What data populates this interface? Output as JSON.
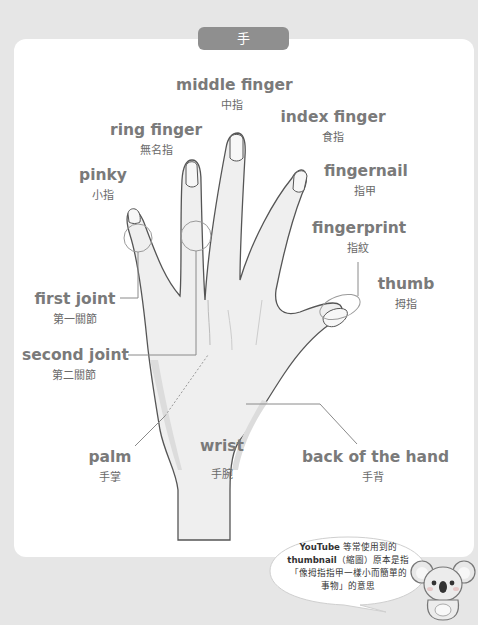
{
  "title": "手",
  "labels": {
    "middle_finger": {
      "en": "middle finger",
      "zh": "中指"
    },
    "index_finger": {
      "en": "index finger",
      "zh": "食指"
    },
    "ring_finger": {
      "en": "ring finger",
      "zh": "無名指"
    },
    "pinky": {
      "en": "pinky",
      "zh": "小指"
    },
    "fingernail": {
      "en": "fingernail",
      "zh": "指甲"
    },
    "fingerprint": {
      "en": "fingerprint",
      "zh": "指紋"
    },
    "thumb": {
      "en": "thumb",
      "zh": "拇指"
    },
    "first_joint": {
      "en": "first joint",
      "zh": "第一關節"
    },
    "second_joint": {
      "en": "second joint",
      "zh": "第二關節"
    },
    "palm": {
      "en": "palm",
      "zh": "手掌"
    },
    "wrist": {
      "en": "wrist",
      "zh": "手腕"
    },
    "back_of_hand": {
      "en": "back of the hand",
      "zh": "手背"
    }
  },
  "note": {
    "line1_bold": "YouTube",
    "line1_rest": " 等常使用到的",
    "line2_bold": "thumbnail",
    "line2_rest": "（縮圖）原本是指",
    "line3": "「像拇指指甲一樣小而簡單的",
    "line4": "事物」的意思"
  },
  "colors": {
    "background": "#e6e6e6",
    "card": "#ffffff",
    "pill": "#8f8f8f",
    "label_text": "#7a7a7a",
    "hand_fill": "#efefef",
    "hand_outline": "#555555"
  },
  "mascot": "koala-icon"
}
